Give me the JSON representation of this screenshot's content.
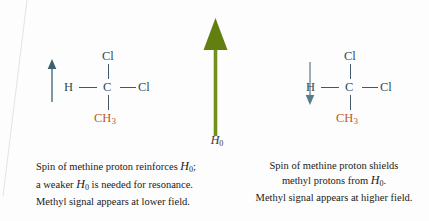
{
  "figure": {
    "background_color": "#fdfdfd",
    "field_arrow": {
      "name": "applied-magnetic-field-arrow",
      "direction": "up",
      "color": "#6d8c14",
      "label_symbol": "H",
      "label_subscript": "0"
    },
    "panels": [
      {
        "id": "left",
        "spin_arrow": {
          "direction": "up",
          "color": "#5f7d8c"
        },
        "molecule": {
          "name": "1,1-dichloroethane",
          "top_atom": "Cl",
          "left_atom": "H",
          "center_atom": "C",
          "right_atom": "Cl",
          "bottom_group": "CH",
          "bottom_group_subscript": "3",
          "bottom_group_color": "#c0562a",
          "atom_color": "#2f4a5a"
        },
        "caption": [
          "Spin of methine proton reinforces H₀;",
          "a weaker H₀ is needed for resonance.",
          "Methyl signal appears at lower field."
        ],
        "caption_parts": {
          "line1_pre": "Spin of methine proton reinforces ",
          "line1_sym": "H",
          "line1_sub": "0",
          "line1_post": ";",
          "line2_pre": "a weaker ",
          "line2_sym": "H",
          "line2_sub": "0",
          "line2_post": " is needed for resonance.",
          "line3": "Methyl signal appears at lower field."
        }
      },
      {
        "id": "right",
        "spin_arrow": {
          "direction": "down",
          "color": "#7f9aa8"
        },
        "molecule": {
          "name": "1,1-dichloroethane",
          "top_atom": "Cl",
          "left_atom": "H",
          "center_atom": "C",
          "right_atom": "Cl",
          "bottom_group": "CH",
          "bottom_group_subscript": "3",
          "bottom_group_color": "#c0562a",
          "atom_color": "#2f4a5a"
        },
        "caption": [
          "Spin of methine proton shields",
          "methyl protons from H₀.",
          "Methyl signal appears at higher field."
        ],
        "caption_parts": {
          "line1": "Spin of methine proton shields",
          "line2_pre": "methyl protons from ",
          "line2_sym": "H",
          "line2_sub": "0",
          "line2_post": ".",
          "line3": "Methyl signal appears at higher field."
        }
      }
    ]
  }
}
